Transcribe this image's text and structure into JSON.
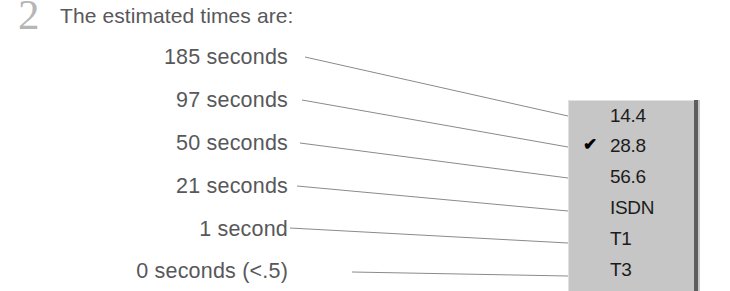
{
  "step": {
    "number": "2",
    "heading": "The estimated times are:"
  },
  "time_labels": [
    {
      "text": "185 seconds",
      "top": 45,
      "connects_to": "14.4"
    },
    {
      "text": "97 seconds",
      "top": 88,
      "connects_to": "28.8"
    },
    {
      "text": "50 seconds",
      "top": 131,
      "connects_to": "56.6"
    },
    {
      "text": "21 seconds",
      "top": 174,
      "connects_to": "ISDN"
    },
    {
      "text": "1 second",
      "top": 217,
      "connects_to": "T1"
    },
    {
      "text": "0 seconds (<.5)",
      "top": 259,
      "connects_to": "T3"
    }
  ],
  "dropdown": {
    "name": "connection-speed-menu",
    "selected": "28.8",
    "background_color": "#c6c6c6",
    "shadow_color": "#5e5e5e",
    "check_glyph": "✔",
    "items": [
      {
        "label": "14.4",
        "checked": false,
        "top": 0
      },
      {
        "label": "28.8",
        "checked": true,
        "top": 30
      },
      {
        "label": "56.6",
        "checked": false,
        "top": 61
      },
      {
        "label": "ISDN",
        "checked": false,
        "top": 92
      },
      {
        "label": "T1",
        "checked": false,
        "top": 123
      },
      {
        "label": "T3",
        "checked": false,
        "top": 154
      }
    ]
  },
  "leader_lines": [
    {
      "x1": 305,
      "y1": 57,
      "x2": 568,
      "y2": 116
    },
    {
      "x1": 302,
      "y1": 100,
      "x2": 568,
      "y2": 147
    },
    {
      "x1": 300,
      "y1": 143,
      "x2": 568,
      "y2": 178
    },
    {
      "x1": 297,
      "y1": 186,
      "x2": 568,
      "y2": 211
    },
    {
      "x1": 290,
      "y1": 228,
      "x2": 568,
      "y2": 243
    },
    {
      "x1": 352,
      "y1": 272,
      "x2": 568,
      "y2": 276
    }
  ],
  "colors": {
    "text": "#58585a",
    "step_number": "#b6b6b6",
    "leader_line": "#8a8a8a",
    "menu_text": "#1c1c1c"
  }
}
